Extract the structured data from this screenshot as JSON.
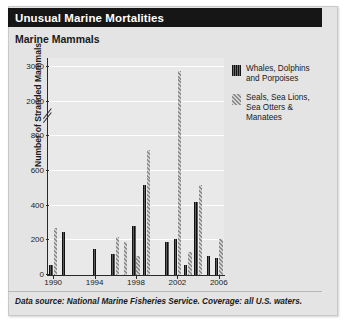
{
  "header": {
    "title": "Unusual Marine Mortalities",
    "subtitle": "Marine Mammals"
  },
  "footer": {
    "source_note": "Data source: National Marine Fisheries Service. Coverage: all U.S. waters."
  },
  "legend": {
    "position": "right",
    "items": [
      {
        "label": "Whales, Dolphins\nand Porpoises",
        "pattern": "vertical-stripes",
        "color": "#2b2b2b"
      },
      {
        "label": "Seals, Sea Lions,\nSea Otters &\nManatees",
        "pattern": "diagonal-stripes",
        "color": "#9a9a9a"
      }
    ]
  },
  "chart_data": {
    "type": "bar",
    "title": "Marine Mammals",
    "xlabel": "",
    "ylabel": "Number of Stranded Mammals",
    "ylim": [
      0,
      3000
    ],
    "y_axis_broken": true,
    "y_break_between": [
      800,
      2000
    ],
    "yticks": [
      0,
      200,
      400,
      600,
      800,
      2000,
      3000
    ],
    "ytick_labels": [
      "0",
      "200",
      "400",
      "600",
      "800",
      "2000",
      "3000"
    ],
    "grid": true,
    "xticks": [
      1990,
      1994,
      1998,
      2002,
      2006
    ],
    "xtick_labels": [
      "1990",
      "1994",
      "1998",
      "2002",
      "2006"
    ],
    "categories": [
      1990,
      1991,
      1992,
      1993,
      1994,
      1995,
      1996,
      1997,
      1998,
      1999,
      2000,
      2001,
      2002,
      2003,
      2004,
      2005,
      2006
    ],
    "series": [
      {
        "name": "Whales, Dolphins and Porpoises",
        "pattern": "vertical-stripes",
        "values": [
          55,
          250,
          0,
          0,
          150,
          0,
          120,
          0,
          280,
          520,
          0,
          190,
          210,
          60,
          420,
          110,
          100
        ]
      },
      {
        "name": "Seals, Sea Lions, Sea Otters & Manatees",
        "pattern": "diagonal-stripes",
        "values": [
          270,
          0,
          0,
          0,
          0,
          0,
          220,
          190,
          110,
          720,
          0,
          0,
          2900,
          130,
          520,
          0,
          205
        ]
      }
    ]
  }
}
